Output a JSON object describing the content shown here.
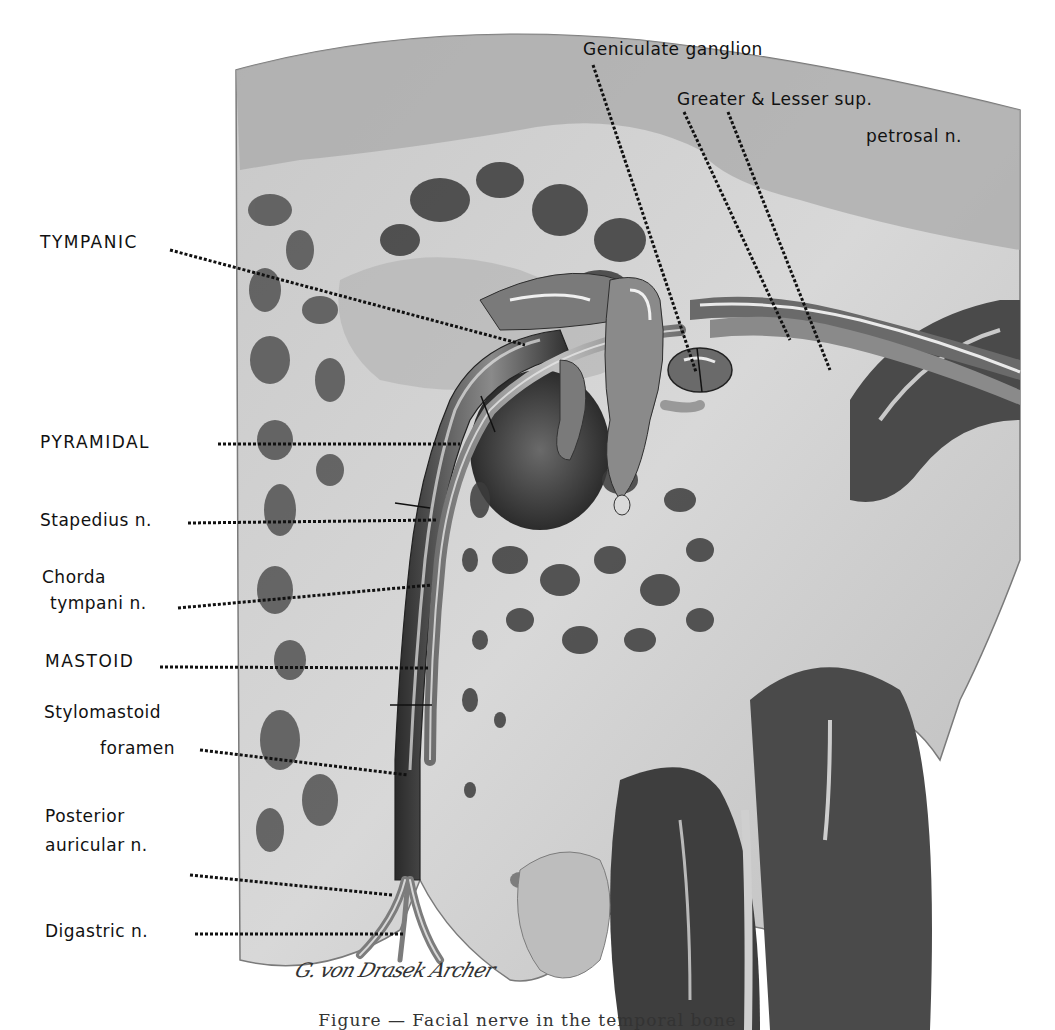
{
  "figure": {
    "title": "Facial nerve in the temporal bone",
    "caption": "Figure — Facial nerve in the temporal bone",
    "signature": "G. von Drasek Archer"
  },
  "labels": {
    "geniculate_ganglion": "Geniculate ganglion",
    "greater_lesser_line1": "Greater & Lesser sup.",
    "greater_lesser_line2": "petrosal n.",
    "tympanic": "TYMPANIC",
    "pyramidal": "PYRAMIDAL",
    "stapedius": "Stapedius n.",
    "chorda_line1": "Chorda",
    "chorda_line2": "tympani n.",
    "mastoid": "MASTOID",
    "stylomastoid_line1": "Stylomastoid",
    "stylomastoid_line2": "foramen",
    "posterior_line1": "Posterior",
    "posterior_line2": "auricular n.",
    "digastric": "Digastric n."
  },
  "colors": {
    "background": "#ffffff",
    "ink": "#111111",
    "bone_light": "#d4d4d4",
    "bone_mid": "#9a9a9a",
    "cavity_dark": "#3a3a3a",
    "nerve": "#8c8c8c",
    "highlight": "#f2f2f2"
  }
}
